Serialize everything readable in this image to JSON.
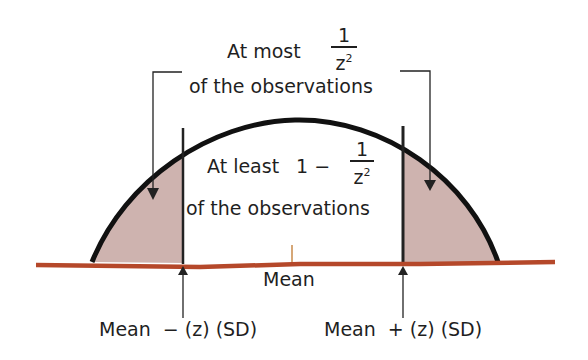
{
  "diagram": {
    "top_label": {
      "prefix": "At most",
      "fraction_numerator": "1",
      "fraction_denominator": "z",
      "denominator_exponent": "2",
      "suffix": "of the observations"
    },
    "center_label": {
      "prefix": "At least",
      "one_minus": "1 −",
      "fraction_numerator": "1",
      "fraction_denominator": "z",
      "denominator_exponent": "2",
      "suffix": "of the observations"
    },
    "axis": {
      "mean_label": "Mean",
      "left_bound_label": "Mean  − (z) (SD)",
      "right_bound_label": "Mean  + (z) (SD)"
    },
    "colors": {
      "curve": "#111111",
      "baseline": "#b5482a",
      "tail_shading": "#c9aba6",
      "mean_tick": "#c98a4a"
    }
  }
}
